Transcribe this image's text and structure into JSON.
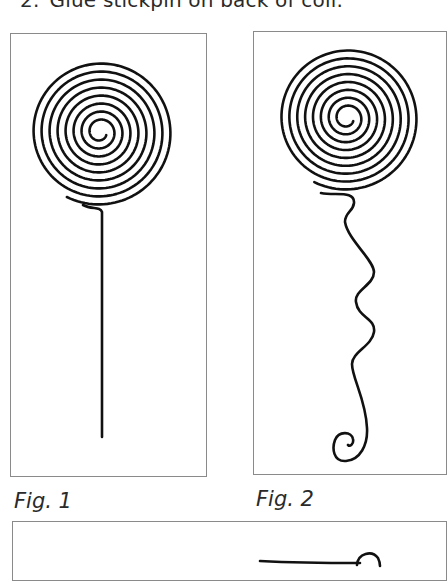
{
  "instructions": {
    "step_number": "2.",
    "step_text": "Glue stickpin on back of coil."
  },
  "figures": [
    {
      "caption": "Fig. 1",
      "description": "spiral coil with straight vertical stem"
    },
    {
      "caption": "Fig. 2",
      "description": "spiral coil with wavy stem ending in small curl"
    },
    {
      "caption": "",
      "description": "stickpin (partially visible)"
    }
  ],
  "colors": {
    "line": "#111111",
    "border": "#8a8a8a",
    "text": "#2a2a2a"
  }
}
